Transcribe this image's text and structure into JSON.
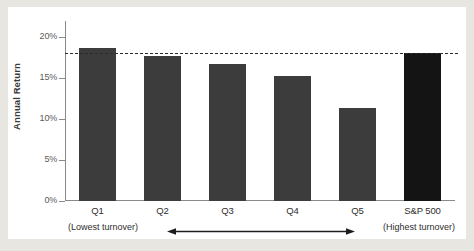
{
  "chart_data": {
    "type": "bar",
    "title": "",
    "subtitle": "",
    "xlabel": "",
    "ylabel": "Annual Return",
    "categories": [
      "Q1",
      "Q2",
      "Q3",
      "Q4",
      "Q5",
      "S&P 500"
    ],
    "values": [
      18.7,
      17.7,
      16.8,
      15.3,
      11.4,
      18.1
    ],
    "ylim": [
      0,
      22
    ],
    "ytick_values": [
      0,
      5,
      10,
      15,
      20
    ],
    "ytick_labels": [
      "0%",
      "5%",
      "10%",
      "15%",
      "20%"
    ],
    "grid": false,
    "legend": null,
    "series": [
      {
        "name": "Annual Return",
        "values": [
          18.7,
          17.7,
          16.8,
          15.3,
          11.4,
          18.1
        ]
      }
    ],
    "bar_colors": [
      "#3c3c3c",
      "#3c3c3c",
      "#3c3c3c",
      "#3c3c3c",
      "#3c3c3c",
      "#141414"
    ],
    "reference_line": {
      "label": "",
      "value": 18.1,
      "style": "dashed",
      "color": "#2b2b2b"
    },
    "annotations": [
      {
        "name": "lowest-turnover",
        "text": "(Lowest turnover)"
      },
      {
        "name": "highest-turnover",
        "text": "(Highest turnover)"
      },
      {
        "name": "turnover-direction-arrow",
        "text": "double-headed-arrow"
      }
    ]
  },
  "colors": {
    "page_background": "#e8e6e1",
    "card_background": "#ffffff",
    "bar": "#3c3c3c",
    "bar_accent": "#141414",
    "axis": "#8a8a8a",
    "text": "#2e2e2e",
    "tick_text": "#5a5a5a"
  }
}
